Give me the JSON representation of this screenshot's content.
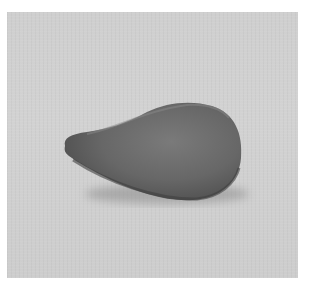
{
  "image": {
    "subject": "teardrop-shaped gray object",
    "background_color": "#d0d0d0",
    "object_color": "#6e6e6e",
    "border_color": "#ffffff"
  }
}
